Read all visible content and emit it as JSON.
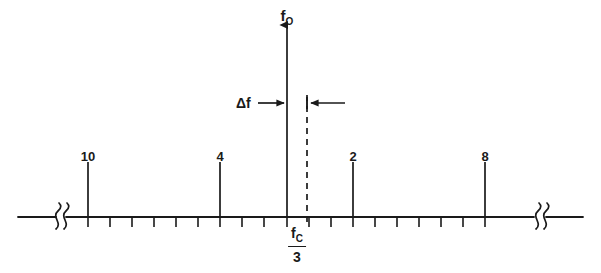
{
  "figure": {
    "type": "frequency-spectrum-line-diagram",
    "title": "",
    "background_color": "#ffffff",
    "line_color": "#1a1a1a",
    "axis": {
      "name": "frequency-axis",
      "y": 217,
      "x_start": 18,
      "x_end": 583,
      "break_symbol": "squiggle",
      "breaks": [
        {
          "name": "left-break",
          "x": 60
        },
        {
          "name": "right-break",
          "x": 540
        }
      ],
      "tick_spacing": 22,
      "tick_first_x": 88,
      "tick_count": 19,
      "tick_length": 10
    },
    "carrier": {
      "name": "carrier-reference",
      "label_numerator": "f",
      "label_numerator_sub": "C",
      "label_denominator": "3",
      "x": 297,
      "label_y": 226
    },
    "main_tone": {
      "name": "f0-arrow",
      "label": "f",
      "label_sub": "O",
      "x": 287,
      "top_y": 25,
      "label_y": 8,
      "arrowhead": true
    },
    "dashed_line": {
      "name": "offset-dashed-line",
      "x": 307,
      "top_y": 95,
      "bottom_y": 226,
      "dash": "6 5"
    },
    "delta": {
      "name": "delta-f-annotation",
      "label": "Δf",
      "label_x": 236,
      "label_y": 96,
      "y": 103,
      "left_arrow_from_x": 258,
      "left_arrow_to_x": 287,
      "right_arrow_from_x": 345,
      "right_arrow_to_x": 307,
      "tick_x": 307,
      "tick_half_height": 6
    },
    "spikes": [
      {
        "name": "spike-10",
        "label": "10",
        "x": 88,
        "height": 55,
        "label_y": 150
      },
      {
        "name": "spike-4",
        "label": "4",
        "x": 220,
        "height": 55,
        "label_y": 150
      },
      {
        "name": "spike-2",
        "label": "2",
        "x": 353,
        "height": 55,
        "label_y": 150
      },
      {
        "name": "spike-8",
        "label": "8",
        "x": 485,
        "height": 55,
        "label_y": 150
      }
    ]
  },
  "chart_data": {
    "type": "line",
    "title": "",
    "xlabel": "frequency",
    "ylabel": "",
    "grid": false,
    "legend": null,
    "annotations": [
      "f_O",
      "Δf",
      "f_C / 3"
    ],
    "categories": [
      "10",
      "4",
      "2",
      "8"
    ],
    "values": [
      1,
      1,
      1,
      1
    ],
    "x_positions_px": [
      88,
      220,
      353,
      485
    ],
    "reference_marker_px": 287,
    "dashed_marker_px": 307,
    "axis_break_positions_px": [
      60,
      540
    ],
    "tick_positions_px": [
      88,
      110,
      132,
      154,
      176,
      198,
      220,
      242,
      264,
      287,
      309,
      331,
      353,
      375,
      397,
      419,
      441,
      463,
      485
    ]
  }
}
